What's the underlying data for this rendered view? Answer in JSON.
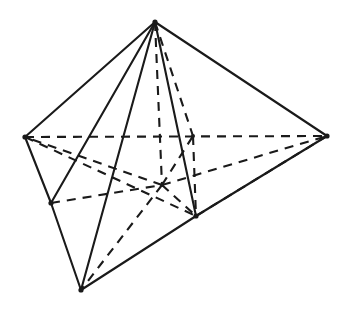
{
  "figure": {
    "kind": "geometric-line-drawing",
    "background_color": "#ffffff",
    "line_color": "#1a1a1a",
    "canvas": {
      "width": 352,
      "height": 335
    },
    "style": {
      "visible_edge_style": "solid",
      "hidden_edge_style": "dashed",
      "stroke_width": 2.1,
      "dash_pattern": "9 7"
    },
    "vertices": {
      "apex": {
        "label": "apex",
        "x": 155,
        "y": 22,
        "visible": true
      },
      "left": {
        "label": "left-base",
        "x": 25,
        "y": 137,
        "visible": true
      },
      "right": {
        "label": "right-base",
        "x": 327,
        "y": 136,
        "visible": true
      },
      "bottom": {
        "label": "bottom-base",
        "x": 81,
        "y": 290,
        "visible": true
      },
      "midleft": {
        "label": "mid-left-base",
        "x": 51,
        "y": 203,
        "visible": true
      },
      "bottomright": {
        "label": "bottom-right-base",
        "x": 196,
        "y": 216,
        "visible": true
      },
      "back": {
        "label": "back-base",
        "x": 193,
        "y": 136,
        "visible": false
      },
      "center": {
        "label": "base-center",
        "x": 162,
        "y": 185,
        "visible": false
      }
    },
    "edges_solid": [
      {
        "name": "apex-to-left",
        "from": "apex",
        "to": "left"
      },
      {
        "name": "apex-to-midleft",
        "from": "apex",
        "to": "midleft"
      },
      {
        "name": "apex-to-bottom",
        "from": "apex",
        "to": "bottom"
      },
      {
        "name": "apex-to-bottomright",
        "from": "apex",
        "to": "bottomright"
      },
      {
        "name": "apex-to-right",
        "from": "apex",
        "to": "right"
      },
      {
        "name": "left-to-midleft",
        "from": "left",
        "to": "midleft"
      },
      {
        "name": "midleft-to-bottom",
        "from": "midleft",
        "to": "bottom"
      },
      {
        "name": "bottom-to-bottomright",
        "from": "bottom",
        "to": "bottomright"
      },
      {
        "name": "bottomright-to-right",
        "from": "bottomright",
        "to": "right"
      }
    ],
    "edges_hidden": [
      {
        "name": "left-to-right-diagonal",
        "from": "left",
        "to": "right"
      },
      {
        "name": "left-to-back-lower",
        "from": "left",
        "to": "bottomright"
      },
      {
        "name": "midleft-to-center",
        "from": "midleft",
        "to": "center"
      },
      {
        "name": "apex-to-center",
        "from": "apex",
        "to": "center"
      },
      {
        "name": "apex-to-back",
        "from": "apex",
        "to": "back"
      },
      {
        "name": "back-to-bottomright",
        "from": "back",
        "to": "bottomright"
      },
      {
        "name": "right-to-bottomright-inner",
        "from": "right",
        "to": "bottomright"
      },
      {
        "name": "center-to-left",
        "from": "center",
        "to": "left"
      },
      {
        "name": "center-to-bottom",
        "from": "center",
        "to": "bottom"
      },
      {
        "name": "center-to-right",
        "from": "center",
        "to": "right"
      },
      {
        "name": "center-to-back",
        "from": "center",
        "to": "back"
      },
      {
        "name": "center-to-bottomright",
        "from": "center",
        "to": "bottomright"
      }
    ]
  }
}
